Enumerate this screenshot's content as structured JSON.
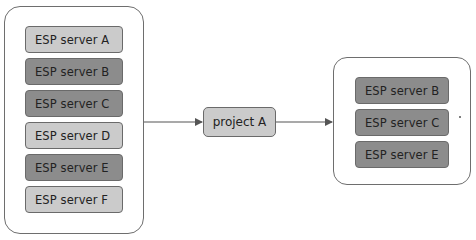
{
  "diagram": {
    "source_group": {
      "servers": [
        {
          "label": "ESP server A",
          "shade": "light"
        },
        {
          "label": "ESP server B",
          "shade": "dark"
        },
        {
          "label": "ESP server C",
          "shade": "dark"
        },
        {
          "label": "ESP server D",
          "shade": "light"
        },
        {
          "label": "ESP server E",
          "shade": "dark"
        },
        {
          "label": "ESP server F",
          "shade": "light"
        }
      ]
    },
    "project": {
      "label": "project A"
    },
    "target_group": {
      "servers": [
        {
          "label": "ESP server B",
          "shade": "dark"
        },
        {
          "label": "ESP server C",
          "shade": "dark"
        },
        {
          "label": "ESP server E",
          "shade": "dark"
        }
      ]
    },
    "colors": {
      "light_box": "#cbcbcb",
      "dark_box": "#8c8c8c",
      "border": "#6e6e6e",
      "connector": "#555555"
    }
  }
}
